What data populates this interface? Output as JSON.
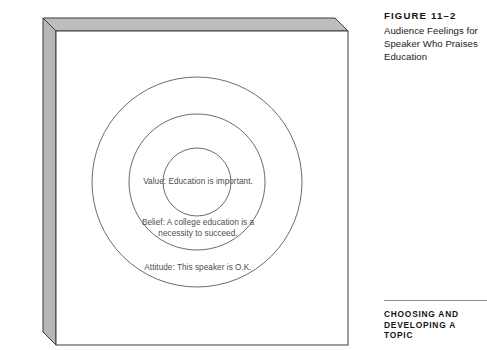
{
  "figure": {
    "label": "FIGURE 11–2",
    "caption": "Audience Feelings for Speaker Who Praises Education"
  },
  "diagram": {
    "alt": "Three concentric circles on a three-dimensional white panel",
    "rings": [
      {
        "id": "inner",
        "name": "value",
        "text": "Value: Education is important."
      },
      {
        "id": "middle",
        "name": "belief",
        "text": "Belief: A college education is a\nnecessity to succeed."
      },
      {
        "id": "outer",
        "name": "attitude",
        "text": "Attitude: This speaker is O.K."
      }
    ]
  },
  "footer": {
    "text": "CHOOSING AND\nDEVELOPING A TOPIC"
  },
  "colors": {
    "panel_face": "#ffffff",
    "panel_side": "#b7b7b7",
    "panel_top": "#bdbdbd",
    "outline": "#3c3c3c",
    "ring_stroke": "#5a5a5a",
    "label_text": "#4d4d4d",
    "caption_text": "#141414",
    "rule": "#8c8c8c"
  }
}
